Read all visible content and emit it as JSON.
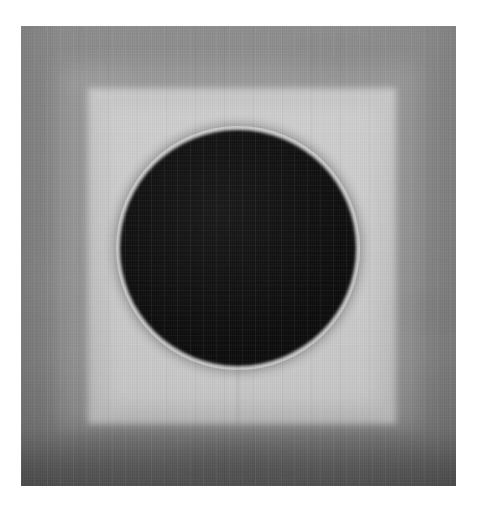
{
  "page": {
    "background_color": "#ffffff",
    "width": 480,
    "height": 511
  },
  "artwork": {
    "title": "",
    "description": "Photograph of a grayscale painted panel: a textured gray field containing a lighter square inset with a large near-black circle centered inside it.",
    "medium_appearance": "painted canvas with visible weave texture",
    "plate": {
      "left": 21,
      "top": 26,
      "width": 435,
      "height": 460,
      "border_color": "#8a8a8a",
      "bottom_band_color": "#6a6a6a"
    },
    "elements": [
      {
        "name": "outer-field",
        "shape": "rectangle",
        "color": "#8a8a8a",
        "note": "gray surround, lighter at top, darkening toward the bottom edge"
      },
      {
        "name": "halo-square",
        "shape": "square",
        "color": "#a6a6a6",
        "note": "soft intermediate-tone square between the surround and the bright square"
      },
      {
        "name": "inner-square",
        "shape": "square",
        "color": "#c3c3c3",
        "left": 88,
        "top": 88,
        "right": 395,
        "bottom": 423
      },
      {
        "name": "circle",
        "shape": "circle",
        "color": "#0d0d0d",
        "center_x": 237,
        "center_y": 247,
        "diameter": 236,
        "left": 120,
        "top": 130,
        "right": 355,
        "bottom": 365
      }
    ],
    "palette": {
      "near_black": "#0d0d0d",
      "light_square": "#c3c3c3",
      "mid_gray": "#8a8a8a",
      "dark_band": "#6a6a6a",
      "page_white": "#ffffff"
    }
  }
}
